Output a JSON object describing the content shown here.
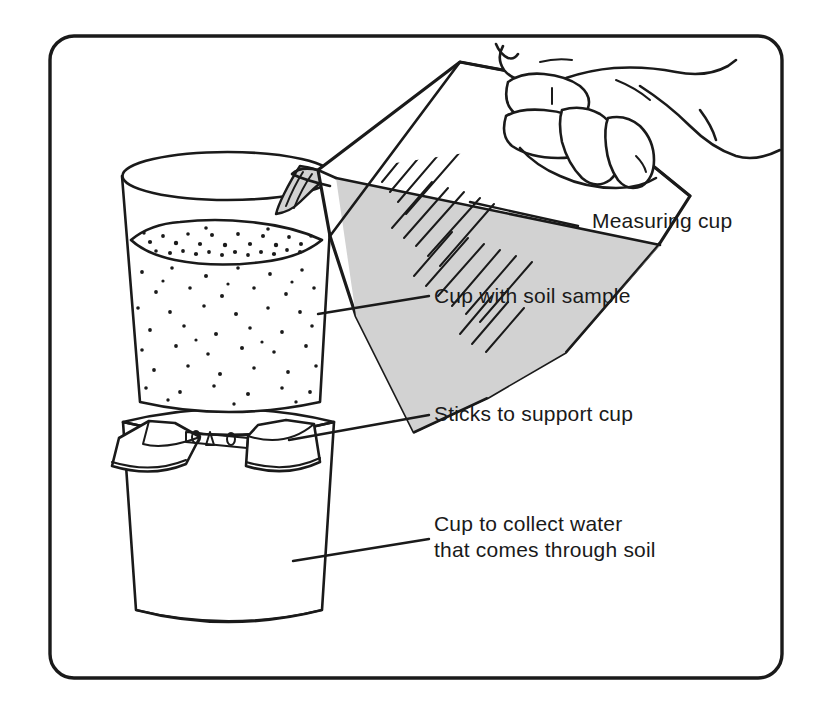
{
  "figure": {
    "border_color": "#1a1a1a",
    "background_color": "#ffffff",
    "ink_color": "#1a1a1a",
    "water_fill_color": "#d2d2d2",
    "callouts": [
      {
        "id": "measuring-cup",
        "label": "Measuring cup",
        "lines": [
          "Measuring cup"
        ],
        "text_x": 592,
        "text_y": 228,
        "leader": {
          "x1": 470,
          "y1": 202,
          "x2": 578,
          "y2": 226
        }
      },
      {
        "id": "cup-with-soil-sample",
        "label": "Cup with soil sample",
        "lines": [
          "Cup with soil sample"
        ],
        "text_x": 434,
        "text_y": 303,
        "leader": {
          "x1": 318,
          "y1": 314,
          "x2": 429,
          "y2": 296
        }
      },
      {
        "id": "sticks-to-support-cup",
        "label": "Sticks to support cup",
        "lines": [
          "Sticks to support cup"
        ],
        "text_x": 434,
        "text_y": 421,
        "leader": {
          "x1": 289,
          "y1": 440,
          "x2": 429,
          "y2": 415
        }
      },
      {
        "id": "cup-to-collect-water",
        "label": "Cup to collect water that comes through soil",
        "lines": [
          "Cup to collect water",
          "that comes through soil"
        ],
        "text_x": 434,
        "text_y": 531,
        "line_height": 26,
        "leader": {
          "x1": 293,
          "y1": 561,
          "x2": 429,
          "y2": 539
        }
      }
    ],
    "objects": [
      {
        "id": "measuring-cup",
        "name": "measuring-cup",
        "state": "tilted-pouring",
        "contents": "water"
      },
      {
        "id": "hand",
        "name": "hand-holding-cup",
        "state": "gripping-handle"
      },
      {
        "id": "water-stream",
        "name": "water-stream",
        "state": "pouring"
      },
      {
        "id": "soil-cup",
        "name": "cup-with-soil-sample",
        "contents": "soil"
      },
      {
        "id": "sticks",
        "name": "support-sticks",
        "count": 2
      },
      {
        "id": "collection-cup",
        "name": "collection-cup",
        "contents": "empty"
      }
    ]
  }
}
